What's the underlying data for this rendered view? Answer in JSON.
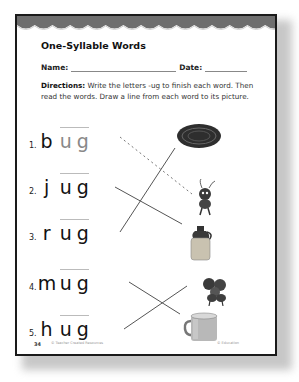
{
  "worksheet": {
    "title": "One-Syllable Words",
    "name_label": "Name:",
    "date_label": "Date:",
    "directions_label": "Directions:",
    "directions_text": " Write the letters -ug to finish each word. Then read the words. Draw a line from each word to its picture.",
    "words": [
      {
        "number": "1.",
        "first_letter": "b",
        "ending": "ug",
        "traced": true
      },
      {
        "number": "2.",
        "first_letter": "j",
        "ending": "ug",
        "traced": false
      },
      {
        "number": "3.",
        "first_letter": "r",
        "ending": "ug",
        "traced": false
      },
      {
        "number": "4.",
        "first_letter": "m",
        "ending": "ug",
        "traced": false
      },
      {
        "number": "5.",
        "first_letter": "h",
        "ending": "ug",
        "traced": false
      }
    ],
    "pictures": [
      {
        "name": "rug-icon"
      },
      {
        "name": "bug-icon"
      },
      {
        "name": "jug-icon"
      },
      {
        "name": "bugs-icon"
      },
      {
        "name": "mug-icon"
      }
    ],
    "footer": {
      "page_number": "34",
      "left_text": "© Teacher Created Resources",
      "right_text": "© Education"
    }
  }
}
